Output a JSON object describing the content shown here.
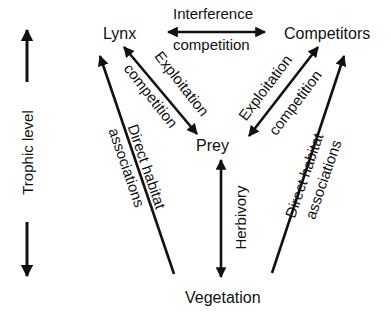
{
  "nodes": {
    "lynx": "Lynx",
    "competitors": "Competitors",
    "prey": "Prey",
    "vegetation": "Vegetation"
  },
  "axis": {
    "trophic_level": "Trophic level"
  },
  "relations": {
    "interference_line1": "Interference",
    "interference_line2": "competition",
    "exploitation_left_line1": "Exploitation",
    "exploitation_left_line2": "competition",
    "exploitation_right_line1": "Exploitation",
    "exploitation_right_line2": "competition",
    "habitat_left_line1": "Direct habitat",
    "habitat_left_line2": "associations",
    "habitat_right_line1": "Direct habitat",
    "habitat_right_line2": "associations",
    "herbivory": "Herbivory"
  },
  "colors": {
    "ink": "#111111",
    "background": "#ffffff"
  }
}
